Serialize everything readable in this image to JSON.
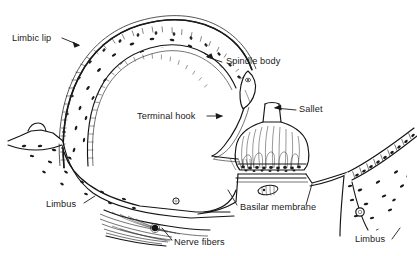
{
  "figure": {
    "background_color": "#ffffff",
    "ink_color": "#141414",
    "text_color": "#1a1a1a",
    "width": 417,
    "height": 256
  },
  "labels": [
    {
      "id": "limbic-lip",
      "text": "Limbic lip",
      "x": 12,
      "y": 41,
      "anchor": "start"
    },
    {
      "id": "spindle-body",
      "text": "Spindle body",
      "x": 226,
      "y": 64,
      "anchor": "start"
    },
    {
      "id": "sallet",
      "text": "Sallet",
      "x": 299,
      "y": 112,
      "anchor": "start"
    },
    {
      "id": "terminal-hook",
      "text": "Terminal hook",
      "x": 137,
      "y": 119,
      "anchor": "start"
    },
    {
      "id": "limbus-left",
      "text": "Limbus",
      "x": 46,
      "y": 207,
      "anchor": "start"
    },
    {
      "id": "basilar-membrane",
      "text": "Basilar membrane",
      "x": 240,
      "y": 210,
      "anchor": "start"
    },
    {
      "id": "nerve-fibers",
      "text": "Nerve fibers",
      "x": 174,
      "y": 245,
      "anchor": "start"
    },
    {
      "id": "limbus-right",
      "text": "Limbus",
      "x": 355,
      "y": 242,
      "anchor": "start"
    }
  ],
  "structures": [
    {
      "id": "limbic-lip-arch",
      "name": "Limbic lip",
      "description": "Curved arch of stippled connective tissue with banded epithelial border"
    },
    {
      "id": "spindle-body-form",
      "name": "Spindle body",
      "description": "Small elongated lens-shaped body at the free end of the limbic lip"
    },
    {
      "id": "terminal-hook-form",
      "name": "Terminal hook",
      "description": "Fiber strand descending from spindle body to the sallet"
    },
    {
      "id": "sallet-form",
      "name": "Sallet",
      "description": "Dome-shaped gelatinous cupula with vertical fibers over hair cells"
    },
    {
      "id": "basilar-membrane-form",
      "name": "Basilar membrane",
      "description": "Thin horizontal membrane supporting the sensory epithelium"
    },
    {
      "id": "nerve-fibers-form",
      "name": "Nerve fibers",
      "description": "Bundle of striated nerve fibers beneath the limbus"
    },
    {
      "id": "limbus-left-mass",
      "name": "Limbus",
      "description": "Stippled limbic mass on the left side"
    },
    {
      "id": "limbus-right-mass",
      "name": "Limbus",
      "description": "Stippled triangular limbic mass on the right side"
    }
  ]
}
